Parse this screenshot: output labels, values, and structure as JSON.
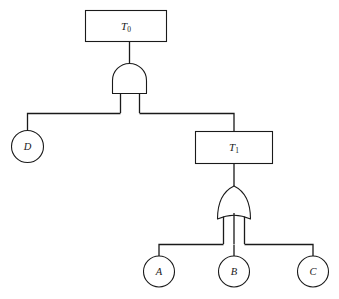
{
  "diagram": {
    "type": "fault-tree",
    "title": "",
    "colors": {
      "stroke": "#1a1a1a",
      "fill": "#ffffff",
      "background": "#ffffff"
    },
    "top_event": {
      "id": "T0",
      "label": "T",
      "subscript": "0",
      "shape": "rectangle"
    },
    "intermediate_event": {
      "id": "T1",
      "label": "T",
      "subscript": "1",
      "shape": "rectangle"
    },
    "gates": [
      {
        "id": "and-gate",
        "type": "AND",
        "symbol_name": "and-gate-symbol",
        "output_to": "T0",
        "inputs": [
          "D",
          "T1"
        ]
      },
      {
        "id": "or-gate",
        "type": "OR",
        "symbol_name": "or-gate-symbol",
        "output_to": "T1",
        "inputs": [
          "A",
          "B",
          "C"
        ]
      }
    ],
    "basic_events": [
      {
        "id": "D",
        "label": "D",
        "shape": "circle"
      },
      {
        "id": "A",
        "label": "A",
        "shape": "circle"
      },
      {
        "id": "B",
        "label": "B",
        "shape": "circle"
      },
      {
        "id": "C",
        "label": "C",
        "shape": "circle"
      }
    ]
  }
}
